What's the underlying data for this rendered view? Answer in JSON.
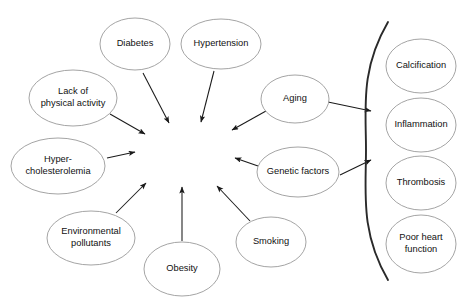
{
  "diagram": {
    "type": "concept-map",
    "colors": {
      "central_fill": "#d2d2d2",
      "node_fill": "#ffffff",
      "node_stroke": "#9a9a9a",
      "edge": "#1a1a1a",
      "brace": "#2a2a2a",
      "background": "#ffffff"
    },
    "central": {
      "id": "atherosclerosis",
      "label": "Atherosclerosis",
      "cx": 184.5,
      "cy": 152,
      "rx": 48,
      "ry": 30.5
    },
    "risk_factors": [
      {
        "id": "diabetes",
        "label": "Diabetes",
        "lines": [
          "Diabetes"
        ],
        "cx": 135,
        "cy": 44,
        "rx": 35,
        "ry": 26
      },
      {
        "id": "hypertension",
        "label": "Hypertension",
        "lines": [
          "Hypertension"
        ],
        "cx": 221,
        "cy": 44,
        "rx": 40,
        "ry": 25
      },
      {
        "id": "lack-physical-activity",
        "label": "Lack of physical activity",
        "lines": [
          "Lack of",
          "physical activity"
        ],
        "cx": 73,
        "cy": 98,
        "rx": 44,
        "ry": 28
      },
      {
        "id": "hypercholesterolemia",
        "label": "Hyper-cholesterolemia",
        "lines": [
          "Hyper-",
          "cholesterolemia"
        ],
        "cx": 58,
        "cy": 166,
        "rx": 47,
        "ry": 28
      },
      {
        "id": "environmental-pollutants",
        "label": "Environmental pollutants",
        "lines": [
          "Environmental",
          "pollutants"
        ],
        "cx": 91,
        "cy": 238,
        "rx": 44,
        "ry": 27
      },
      {
        "id": "obesity",
        "label": "Obesity",
        "lines": [
          "Obesity"
        ],
        "cx": 182,
        "cy": 269,
        "rx": 38,
        "ry": 27
      },
      {
        "id": "smoking",
        "label": "Smoking",
        "lines": [
          "Smoking"
        ],
        "cx": 271,
        "cy": 242,
        "rx": 35,
        "ry": 25
      },
      {
        "id": "genetic-factors",
        "label": "Genetic factors",
        "lines": [
          "Genetic factors"
        ],
        "cx": 298,
        "cy": 172,
        "rx": 41,
        "ry": 25
      },
      {
        "id": "aging",
        "label": "Aging",
        "lines": [
          "Aging"
        ],
        "cx": 295,
        "cy": 99,
        "rx": 34,
        "ry": 24
      }
    ],
    "outcomes": [
      {
        "id": "calcification",
        "label": "Calcification",
        "lines": [
          "Calcification"
        ],
        "cx": 421,
        "cy": 66,
        "rx": 35,
        "ry": 27
      },
      {
        "id": "inflammation",
        "label": "Inflammation",
        "lines": [
          "Inflammation"
        ],
        "cx": 421,
        "cy": 125,
        "rx": 35,
        "ry": 27
      },
      {
        "id": "thrombosis",
        "label": "Thrombosis",
        "lines": [
          "Thrombosis"
        ],
        "cx": 421,
        "cy": 183,
        "rx": 35,
        "ry": 27
      },
      {
        "id": "poor-heart-function",
        "label": "Poor heart function",
        "lines": [
          "Poor heart",
          "function"
        ],
        "cx": 421,
        "cy": 244,
        "rx": 35,
        "ry": 29
      }
    ],
    "edges": [
      {
        "id": "diabetes-to-atherosclerosis",
        "from": "diabetes",
        "to": "atherosclerosis",
        "x1": 143,
        "y1": 73,
        "x2": 169,
        "y2": 123
      },
      {
        "id": "hypertension-to-atherosclerosis",
        "from": "hypertension",
        "to": "atherosclerosis",
        "x1": 214,
        "y1": 71,
        "x2": 201,
        "y2": 122
      },
      {
        "id": "lack-activity-to-atherosclerosis",
        "from": "lack-physical-activity",
        "to": "atherosclerosis",
        "x1": 110,
        "y1": 114,
        "x2": 145,
        "y2": 134
      },
      {
        "id": "hypercholesterolemia-to-atherosclerosis",
        "from": "hypercholesterolemia",
        "to": "atherosclerosis",
        "x1": 107,
        "y1": 158,
        "x2": 135,
        "y2": 152
      },
      {
        "id": "pollutants-to-atherosclerosis",
        "from": "environmental-pollutants",
        "to": "atherosclerosis",
        "x1": 116,
        "y1": 213,
        "x2": 146,
        "y2": 183
      },
      {
        "id": "obesity-to-atherosclerosis",
        "from": "obesity",
        "to": "atherosclerosis",
        "x1": 182,
        "y1": 241,
        "x2": 182,
        "y2": 187
      },
      {
        "id": "smoking-to-atherosclerosis",
        "from": "smoking",
        "to": "atherosclerosis",
        "x1": 250,
        "y1": 221,
        "x2": 217,
        "y2": 186
      },
      {
        "id": "genetic-to-atherosclerosis",
        "from": "genetic-factors",
        "to": "atherosclerosis",
        "x1": 258,
        "y1": 166,
        "x2": 235,
        "y2": 158
      },
      {
        "id": "aging-to-atherosclerosis",
        "from": "aging",
        "to": "atherosclerosis",
        "x1": 266,
        "y1": 111,
        "x2": 232,
        "y2": 130
      },
      {
        "id": "aging-to-outcomes",
        "from": "aging",
        "to": "outcomes-brace",
        "x1": 328,
        "y1": 102,
        "x2": 371,
        "y2": 111
      },
      {
        "id": "genetic-to-outcomes",
        "from": "genetic-factors",
        "to": "outcomes-brace",
        "x1": 340,
        "y1": 175,
        "x2": 371,
        "y2": 160
      }
    ],
    "brace": {
      "id": "outcomes-brace",
      "label": "outcomes-grouping-brace",
      "top_x": 388,
      "top_y": 22,
      "mid_x": 366,
      "mid_y": 150,
      "bottom_x": 388,
      "bottom_y": 280
    }
  }
}
